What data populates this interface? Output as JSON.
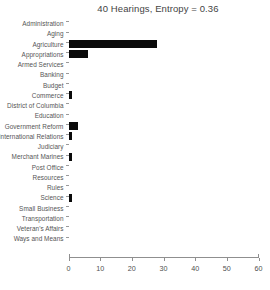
{
  "chart_data": {
    "type": "bar",
    "orientation": "horizontal",
    "title": "40 Hearings, Entropy = 0.36",
    "xlabel": "",
    "ylabel": "",
    "xlim": [
      0,
      60
    ],
    "xticks": [
      0,
      10,
      20,
      30,
      40,
      50,
      60
    ],
    "xtick_labels": [
      "0",
      "10",
      "20",
      "30",
      "40",
      "50",
      "60"
    ],
    "grid": false,
    "legend": false,
    "bar_color": "#0a0a0a",
    "axis_color": "#8f8f8f",
    "background": "#ffffff",
    "categories": [
      "Administration",
      "Aging",
      "Agriculture",
      "Appropriations",
      "Armed Services",
      "Banking",
      "Budget",
      "Commerce",
      "District of Columbia",
      "Education",
      "Government Reform",
      "International Relations",
      "Judiciary",
      "Merchant Marines",
      "Post Office",
      "Resources",
      "Rules",
      "Science",
      "Small Business",
      "Transportation",
      "Veteran's Affairs",
      "Ways and Means"
    ],
    "values": [
      0,
      0,
      28,
      6,
      0,
      0,
      0,
      1,
      0,
      0,
      3,
      1,
      0,
      1,
      0,
      0,
      0,
      1,
      0,
      0,
      0,
      0
    ]
  }
}
